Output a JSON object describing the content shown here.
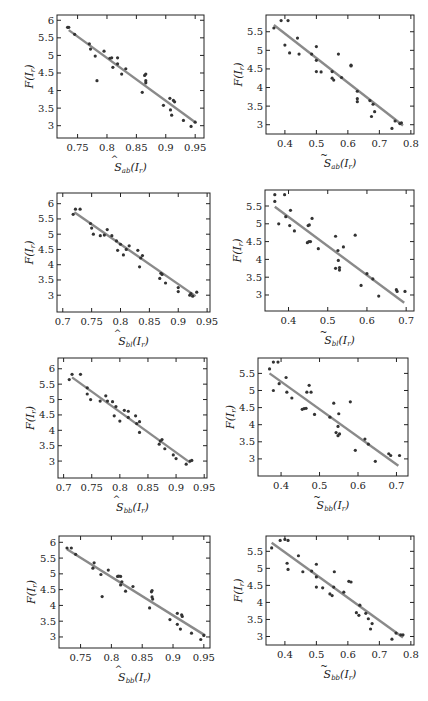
{
  "chart_data": [
    {
      "type": "scatter",
      "panel": "row1-left",
      "xlabel": "Ŝ_ab(I_r)",
      "xlabel_base": "S",
      "xlabel_accent": "hat",
      "xlabel_sub": "ab",
      "xlabel_arg": "(I",
      "ylabel": "F(I_r)",
      "xticks": [
        0.75,
        0.8,
        0.85,
        0.9,
        0.95
      ],
      "xtick_labels": [
        "0.75",
        "0.8",
        "0.85",
        "0.9",
        "0.95"
      ],
      "yticks": [
        3,
        3.5,
        4,
        4.5,
        5,
        5.5,
        6
      ],
      "ytick_labels": [
        "3",
        "3.5",
        "4",
        "4.5",
        "5",
        "5.5",
        "6"
      ],
      "xlim": [
        0.715,
        0.965
      ],
      "ylim": [
        2.65,
        6.15
      ],
      "fit_line": [
        [
          0.735,
          5.72
        ],
        [
          0.95,
          3.1
        ]
      ],
      "points": [
        [
          0.733,
          5.8
        ],
        [
          0.735,
          5.8
        ],
        [
          0.745,
          5.6
        ],
        [
          0.77,
          5.33
        ],
        [
          0.772,
          5.18
        ],
        [
          0.78,
          4.98
        ],
        [
          0.783,
          4.28
        ],
        [
          0.795,
          5.12
        ],
        [
          0.805,
          4.92
        ],
        [
          0.808,
          4.93
        ],
        [
          0.81,
          4.66
        ],
        [
          0.818,
          4.93
        ],
        [
          0.818,
          4.76
        ],
        [
          0.825,
          4.47
        ],
        [
          0.832,
          4.62
        ],
        [
          0.86,
          3.95
        ],
        [
          0.864,
          4.43
        ],
        [
          0.866,
          4.47
        ],
        [
          0.866,
          4.28
        ],
        [
          0.866,
          4.22
        ],
        [
          0.896,
          3.58
        ],
        [
          0.907,
          3.78
        ],
        [
          0.908,
          3.45
        ],
        [
          0.91,
          3.3
        ],
        [
          0.913,
          3.72
        ],
        [
          0.915,
          3.68
        ],
        [
          0.93,
          3.15
        ],
        [
          0.943,
          2.98
        ],
        [
          0.95,
          3.1
        ]
      ]
    },
    {
      "type": "scatter",
      "panel": "row1-right",
      "xlabel": "S̃_ab(I_r)",
      "xlabel_base": "S",
      "xlabel_accent": "tilde",
      "xlabel_sub": "ab",
      "xlabel_arg": "(I",
      "ylabel": "F(I_r)",
      "xticks": [
        0.4,
        0.5,
        0.6,
        0.7,
        0.8
      ],
      "xtick_labels": [
        "0.4",
        "0.5",
        "0.6",
        "0.7",
        "0.8"
      ],
      "yticks": [
        3,
        3.5,
        4,
        4.5,
        5,
        5.5
      ],
      "ytick_labels": [
        "3",
        "3.5",
        "4",
        "4.5",
        "5",
        "5.5"
      ],
      "xlim": [
        0.34,
        0.81
      ],
      "ylim": [
        2.75,
        5.95
      ],
      "fit_line": [
        [
          0.365,
          5.68
        ],
        [
          0.775,
          2.98
        ]
      ],
      "points": [
        [
          0.365,
          5.6
        ],
        [
          0.388,
          5.8
        ],
        [
          0.41,
          5.8
        ],
        [
          0.4,
          5.14
        ],
        [
          0.415,
          4.93
        ],
        [
          0.44,
          5.33
        ],
        [
          0.445,
          4.9
        ],
        [
          0.485,
          4.9
        ],
        [
          0.5,
          5.1
        ],
        [
          0.5,
          4.73
        ],
        [
          0.5,
          4.43
        ],
        [
          0.515,
          4.42
        ],
        [
          0.55,
          4.43
        ],
        [
          0.55,
          4.25
        ],
        [
          0.555,
          4.2
        ],
        [
          0.57,
          4.9
        ],
        [
          0.58,
          4.27
        ],
        [
          0.61,
          4.6
        ],
        [
          0.61,
          4.58
        ],
        [
          0.63,
          3.9
        ],
        [
          0.63,
          3.7
        ],
        [
          0.63,
          3.62
        ],
        [
          0.67,
          3.65
        ],
        [
          0.675,
          3.22
        ],
        [
          0.68,
          3.55
        ],
        [
          0.685,
          3.35
        ],
        [
          0.74,
          2.9
        ],
        [
          0.75,
          3.1
        ],
        [
          0.765,
          3.03
        ],
        [
          0.77,
          3.05
        ]
      ]
    },
    {
      "type": "scatter",
      "panel": "row2-left",
      "xlabel": "Ŝ_bl(I_r)",
      "xlabel_base": "S",
      "xlabel_accent": "hat",
      "xlabel_sub": "bl",
      "xlabel_arg": "(I",
      "ylabel": "F(I_r)",
      "xticks": [
        0.7,
        0.75,
        0.8,
        0.85,
        0.9,
        0.95
      ],
      "xtick_labels": [
        "0.7",
        "0.75",
        "0.8",
        "0.85",
        "0.9",
        "0.95"
      ],
      "yticks": [
        3,
        3.5,
        4,
        4.5,
        5,
        5.5,
        6
      ],
      "ytick_labels": [
        "3",
        "3.5",
        "4",
        "4.5",
        "5",
        "5.5",
        "6"
      ],
      "xlim": [
        0.69,
        0.955
      ],
      "ylim": [
        2.45,
        6.35
      ],
      "fit_line": [
        [
          0.72,
          5.72
        ],
        [
          0.93,
          2.97
        ]
      ],
      "points": [
        [
          0.718,
          5.65
        ],
        [
          0.722,
          5.82
        ],
        [
          0.73,
          5.82
        ],
        [
          0.748,
          5.35
        ],
        [
          0.75,
          5.2
        ],
        [
          0.753,
          5.0
        ],
        [
          0.765,
          4.95
        ],
        [
          0.772,
          4.97
        ],
        [
          0.777,
          5.15
        ],
        [
          0.785,
          4.95
        ],
        [
          0.793,
          4.78
        ],
        [
          0.795,
          4.47
        ],
        [
          0.8,
          4.67
        ],
        [
          0.805,
          4.32
        ],
        [
          0.81,
          4.5
        ],
        [
          0.815,
          4.62
        ],
        [
          0.83,
          4.47
        ],
        [
          0.833,
          3.93
        ],
        [
          0.835,
          4.22
        ],
        [
          0.838,
          4.3
        ],
        [
          0.868,
          3.55
        ],
        [
          0.87,
          3.72
        ],
        [
          0.872,
          3.68
        ],
        [
          0.878,
          3.4
        ],
        [
          0.9,
          3.25
        ],
        [
          0.9,
          3.12
        ],
        [
          0.92,
          3.0
        ],
        [
          0.922,
          3.05
        ],
        [
          0.932,
          3.1
        ],
        [
          0.925,
          2.97
        ]
      ]
    },
    {
      "type": "scatter",
      "panel": "row2-right",
      "xlabel": "S̃_bl(I_r)",
      "xlabel_base": "S",
      "xlabel_accent": "tilde",
      "xlabel_sub": "bl",
      "xlabel_arg": "(I",
      "ylabel": "F(I_r)",
      "xticks": [
        0.4,
        0.5,
        0.6,
        0.7
      ],
      "xtick_labels": [
        "0.4",
        "0.5",
        "0.6",
        "0.7"
      ],
      "yticks": [
        3,
        3.5,
        4,
        4.5,
        5,
        5.5
      ],
      "ytick_labels": [
        "3",
        "3.5",
        "4",
        "4.5",
        "5",
        "5.5"
      ],
      "xlim": [
        0.34,
        0.72
      ],
      "ylim": [
        2.55,
        5.95
      ],
      "fit_line": [
        [
          0.365,
          5.48
        ],
        [
          0.695,
          2.78
        ]
      ],
      "points": [
        [
          0.365,
          5.82
        ],
        [
          0.365,
          5.63
        ],
        [
          0.39,
          5.82
        ],
        [
          0.393,
          5.2
        ],
        [
          0.375,
          5.0
        ],
        [
          0.405,
          5.38
        ],
        [
          0.403,
          4.95
        ],
        [
          0.415,
          4.8
        ],
        [
          0.45,
          4.95
        ],
        [
          0.453,
          4.97
        ],
        [
          0.46,
          5.15
        ],
        [
          0.448,
          4.47
        ],
        [
          0.452,
          4.5
        ],
        [
          0.456,
          4.5
        ],
        [
          0.476,
          4.3
        ],
        [
          0.52,
          4.65
        ],
        [
          0.526,
          4.25
        ],
        [
          0.527,
          3.97
        ],
        [
          0.53,
          3.77
        ],
        [
          0.53,
          3.7
        ],
        [
          0.52,
          3.75
        ],
        [
          0.54,
          4.35
        ],
        [
          0.57,
          4.68
        ],
        [
          0.585,
          3.27
        ],
        [
          0.6,
          3.6
        ],
        [
          0.615,
          3.45
        ],
        [
          0.63,
          2.97
        ],
        [
          0.675,
          3.15
        ],
        [
          0.677,
          3.1
        ],
        [
          0.697,
          3.1
        ]
      ]
    },
    {
      "type": "scatter",
      "panel": "row3-left",
      "xlabel": "Ŝ_bb(I_r)",
      "xlabel_base": "S",
      "xlabel_accent": "hat",
      "xlabel_sub": "bb",
      "xlabel_arg": "(I",
      "ylabel": "F(I_r)",
      "xticks": [
        0.7,
        0.75,
        0.8,
        0.85,
        0.9,
        0.95
      ],
      "xtick_labels": [
        "0.7",
        "0.75",
        "0.8",
        "0.85",
        "0.9",
        "0.95"
      ],
      "yticks": [
        3,
        3.5,
        4,
        4.5,
        5,
        5.5,
        6
      ],
      "ytick_labels": [
        "3",
        "3.5",
        "4",
        "4.5",
        "5",
        "5.5",
        "6"
      ],
      "xlim": [
        0.69,
        0.955
      ],
      "ylim": [
        2.45,
        6.35
      ],
      "fit_line": [
        [
          0.715,
          5.72
        ],
        [
          0.925,
          2.95
        ]
      ],
      "points": [
        [
          0.71,
          5.65
        ],
        [
          0.715,
          5.82
        ],
        [
          0.73,
          5.82
        ],
        [
          0.742,
          5.38
        ],
        [
          0.742,
          5.18
        ],
        [
          0.748,
          5.0
        ],
        [
          0.765,
          4.95
        ],
        [
          0.775,
          5.12
        ],
        [
          0.778,
          4.95
        ],
        [
          0.787,
          4.93
        ],
        [
          0.79,
          4.47
        ],
        [
          0.793,
          4.77
        ],
        [
          0.8,
          4.3
        ],
        [
          0.808,
          4.65
        ],
        [
          0.815,
          4.62
        ],
        [
          0.815,
          4.42
        ],
        [
          0.828,
          4.47
        ],
        [
          0.83,
          4.22
        ],
        [
          0.835,
          3.93
        ],
        [
          0.835,
          4.28
        ],
        [
          0.87,
          3.55
        ],
        [
          0.872,
          3.65
        ],
        [
          0.875,
          3.7
        ],
        [
          0.88,
          3.4
        ],
        [
          0.895,
          3.2
        ],
        [
          0.9,
          3.08
        ],
        [
          0.918,
          2.9
        ],
        [
          0.925,
          3.0
        ],
        [
          0.928,
          3.02
        ]
      ]
    },
    {
      "type": "scatter",
      "panel": "row3-right",
      "xlabel": "S̃_bb(I_r)",
      "xlabel_base": "S",
      "xlabel_accent": "tilde",
      "xlabel_sub": "bb",
      "xlabel_arg": "(I",
      "ylabel": "F(I_r)",
      "xticks": [
        0.4,
        0.5,
        0.6,
        0.7
      ],
      "xtick_labels": [
        "0.4",
        "0.5",
        "0.6",
        "0.7"
      ],
      "yticks": [
        3,
        3.5,
        4,
        4.5,
        5,
        5.5
      ],
      "ytick_labels": [
        "3",
        "3.5",
        "4",
        "4.5",
        "5",
        "5.5"
      ],
      "xlim": [
        0.34,
        0.73
      ],
      "ylim": [
        2.5,
        5.95
      ],
      "fit_line": [
        [
          0.37,
          5.5
        ],
        [
          0.705,
          2.8
        ]
      ],
      "points": [
        [
          0.37,
          5.63
        ],
        [
          0.38,
          5.83
        ],
        [
          0.392,
          5.83
        ],
        [
          0.38,
          5.0
        ],
        [
          0.395,
          5.2
        ],
        [
          0.413,
          5.38
        ],
        [
          0.415,
          4.95
        ],
        [
          0.428,
          4.78
        ],
        [
          0.455,
          4.45
        ],
        [
          0.46,
          4.47
        ],
        [
          0.465,
          4.48
        ],
        [
          0.467,
          4.95
        ],
        [
          0.473,
          5.15
        ],
        [
          0.478,
          4.95
        ],
        [
          0.487,
          4.3
        ],
        [
          0.527,
          4.22
        ],
        [
          0.537,
          4.63
        ],
        [
          0.543,
          3.77
        ],
        [
          0.548,
          3.95
        ],
        [
          0.548,
          3.68
        ],
        [
          0.552,
          3.73
        ],
        [
          0.55,
          4.32
        ],
        [
          0.58,
          4.67
        ],
        [
          0.593,
          3.25
        ],
        [
          0.618,
          3.58
        ],
        [
          0.627,
          3.43
        ],
        [
          0.645,
          2.93
        ],
        [
          0.68,
          3.15
        ],
        [
          0.685,
          3.1
        ],
        [
          0.708,
          3.1
        ]
      ]
    },
    {
      "type": "scatter",
      "panel": "row4-left",
      "xlabel": "Ŝ_bb(I_r)",
      "xlabel_base": "S",
      "xlabel_accent": "hat",
      "xlabel_sub": "bb",
      "xlabel_arg": "(I",
      "ylabel": "F(I_r)",
      "xticks": [
        0.75,
        0.8,
        0.85,
        0.9,
        0.95
      ],
      "xtick_labels": [
        "0.75",
        "0.8",
        "0.85",
        "0.9",
        "0.95"
      ],
      "yticks": [
        3,
        3.5,
        4,
        4.5,
        5,
        5.5,
        6
      ],
      "ytick_labels": [
        "3",
        "3.5",
        "4",
        "4.5",
        "5",
        "5.5",
        "6"
      ],
      "xlim": [
        0.715,
        0.96
      ],
      "ylim": [
        2.65,
        6.2
      ],
      "fit_line": [
        [
          0.728,
          5.78
        ],
        [
          0.952,
          3.05
        ]
      ],
      "points": [
        [
          0.728,
          5.82
        ],
        [
          0.735,
          5.82
        ],
        [
          0.742,
          5.62
        ],
        [
          0.77,
          5.18
        ],
        [
          0.772,
          5.35
        ],
        [
          0.783,
          4.98
        ],
        [
          0.785,
          4.28
        ],
        [
          0.795,
          5.12
        ],
        [
          0.81,
          4.92
        ],
        [
          0.812,
          4.93
        ],
        [
          0.815,
          4.65
        ],
        [
          0.815,
          4.92
        ],
        [
          0.817,
          4.75
        ],
        [
          0.823,
          4.45
        ],
        [
          0.835,
          4.6
        ],
        [
          0.862,
          3.92
        ],
        [
          0.865,
          4.43
        ],
        [
          0.866,
          4.47
        ],
        [
          0.866,
          4.27
        ],
        [
          0.867,
          4.2
        ],
        [
          0.895,
          3.55
        ],
        [
          0.907,
          3.75
        ],
        [
          0.907,
          3.4
        ],
        [
          0.912,
          3.25
        ],
        [
          0.914,
          3.7
        ],
        [
          0.915,
          3.65
        ],
        [
          0.93,
          3.12
        ],
        [
          0.945,
          2.92
        ],
        [
          0.95,
          3.05
        ]
      ]
    },
    {
      "type": "scatter",
      "panel": "row4-right",
      "xlabel": "S̃_bb(I_r)",
      "xlabel_base": "S",
      "xlabel_accent": "tilde",
      "xlabel_sub": "bb",
      "xlabel_arg": "(I",
      "ylabel": "F(I_r)",
      "xticks": [
        0.4,
        0.5,
        0.6,
        0.7,
        0.8
      ],
      "xtick_labels": [
        "0.4",
        "0.5",
        "0.6",
        "0.7",
        "0.8"
      ],
      "yticks": [
        3,
        3.5,
        4,
        4.5,
        5,
        5.5
      ],
      "ytick_labels": [
        "3",
        "3.5",
        "4",
        "4.5",
        "5",
        "5.5"
      ],
      "xlim": [
        0.34,
        0.81
      ],
      "ylim": [
        2.75,
        5.95
      ],
      "fit_line": [
        [
          0.358,
          5.75
        ],
        [
          0.775,
          2.97
        ]
      ],
      "points": [
        [
          0.358,
          5.6
        ],
        [
          0.385,
          5.82
        ],
        [
          0.4,
          5.85
        ],
        [
          0.41,
          5.82
        ],
        [
          0.407,
          5.15
        ],
        [
          0.41,
          4.97
        ],
        [
          0.443,
          5.37
        ],
        [
          0.457,
          4.9
        ],
        [
          0.485,
          4.92
        ],
        [
          0.5,
          5.12
        ],
        [
          0.5,
          4.75
        ],
        [
          0.5,
          4.45
        ],
        [
          0.52,
          4.43
        ],
        [
          0.543,
          4.25
        ],
        [
          0.55,
          4.2
        ],
        [
          0.555,
          4.45
        ],
        [
          0.557,
          4.9
        ],
        [
          0.587,
          4.3
        ],
        [
          0.603,
          4.62
        ],
        [
          0.61,
          4.6
        ],
        [
          0.627,
          3.7
        ],
        [
          0.635,
          3.62
        ],
        [
          0.638,
          3.92
        ],
        [
          0.657,
          3.68
        ],
        [
          0.665,
          3.52
        ],
        [
          0.672,
          3.22
        ],
        [
          0.677,
          3.38
        ],
        [
          0.74,
          2.92
        ],
        [
          0.753,
          3.1
        ],
        [
          0.768,
          3.05
        ],
        [
          0.775,
          3.05
        ]
      ]
    }
  ]
}
